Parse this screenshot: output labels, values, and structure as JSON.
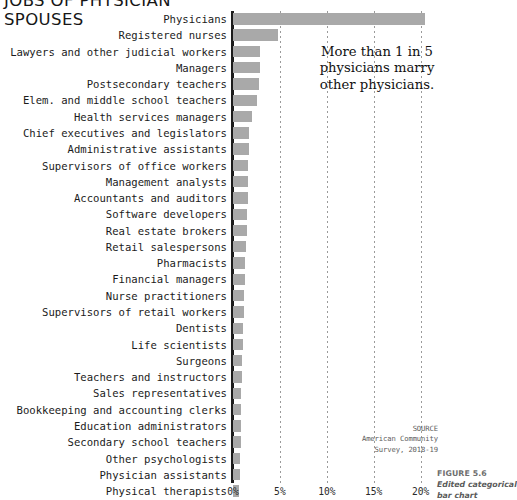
{
  "title": "JOBS OF PHYSICIAN\nSPOUSES",
  "annotation": "More than 1 in 5 physicians marry other physicians.",
  "source": {
    "heading": "SOURCE",
    "line1": "American Community",
    "line2": "Survey, 2018-19"
  },
  "caption": {
    "figure_number": "FIGURE 5.6",
    "figure_text": "Edited categorical bar chart"
  },
  "colors": {
    "bar": "#a9a9a9",
    "axis": "#1c1c1c",
    "grid": "#9a9a9a",
    "text": "#1b1b1b",
    "muted": "#6e6e6e"
  },
  "chart_data": {
    "type": "bar",
    "orientation": "horizontal",
    "title": "JOBS OF PHYSICIAN SPOUSES",
    "xlabel": "",
    "ylabel": "",
    "xlim": [
      0,
      21.5
    ],
    "grid": true,
    "legend": null,
    "tick_labels": [
      "0%",
      "5%",
      "10%",
      "15%",
      "20%"
    ],
    "tick_values": [
      0,
      5,
      10,
      15,
      20
    ],
    "value_unit": "percent",
    "categories": [
      "Physicians",
      "Registered nurses",
      "Lawyers and other judicial workers",
      "Managers",
      "Postsecondary teachers",
      "Elem. and middle school teachers",
      "Health services managers",
      "Chief executives and legislators",
      "Administrative assistants",
      "Supervisors of office workers",
      "Management analysts",
      "Accountants and auditors",
      "Software developers",
      "Real estate brokers",
      "Retail salespersons",
      "Pharmacists",
      "Financial managers",
      "Nurse practitioners",
      "Supervisors of retail workers",
      "Dentists",
      "Life scientists",
      "Surgeons",
      "Teachers and instructors",
      "Sales representatives",
      "Bookkeeping and accounting clerks",
      "Education administrators",
      "Secondary school teachers",
      "Other psychologists",
      "Physician assistants",
      "Physical therapists"
    ],
    "values": [
      20.5,
      4.8,
      2.9,
      2.85,
      2.8,
      2.6,
      2.0,
      1.75,
      1.7,
      1.65,
      1.6,
      1.55,
      1.5,
      1.45,
      1.4,
      1.3,
      1.25,
      1.2,
      1.15,
      1.1,
      1.05,
      1.0,
      0.95,
      0.9,
      0.88,
      0.85,
      0.8,
      0.75,
      0.7,
      0.65
    ],
    "annotations": [
      {
        "text": "More than 1 in 5 physicians marry other physicians.",
        "x": 11.0,
        "y_index": 3
      }
    ]
  }
}
